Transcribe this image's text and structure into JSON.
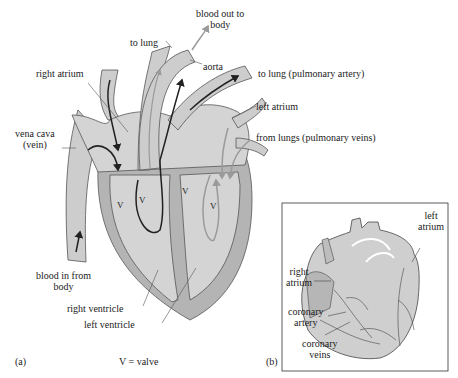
{
  "figure_a": {
    "panel_label": "(a)",
    "legend": "V = valve",
    "labels": {
      "blood_out_to_body_1": "blood out to",
      "blood_out_to_body_2": "body",
      "to_lung": "to lung",
      "aorta": "aorta",
      "to_lung_pulmonary_artery": "to lung (pulmonary artery)",
      "right_atrium": "right atrium",
      "left_atrium": "left atrium",
      "vena_cava_1": "vena cava",
      "vena_cava_2": "(vein)",
      "from_lungs": "from lungs (pulmonary veins)",
      "blood_in_from_body_1": "blood in from",
      "blood_in_from_body_2": "body",
      "right_ventricle": "right ventricle",
      "left_ventricle": "left ventricle",
      "valve_marks": [
        "V",
        "V",
        "V",
        "V"
      ]
    }
  },
  "figure_b": {
    "panel_label": "(b)",
    "labels": {
      "left_atrium_1": "left",
      "left_atrium_2": "atrium",
      "right_atrium_1": "right",
      "right_atrium_2": "atrium",
      "coronary_artery_1": "coronary",
      "coronary_artery_2": "artery",
      "coronary_veins_1": "coronary",
      "coronary_veins_2": "veins"
    }
  },
  "colors": {
    "chamber_fill": "#d4d4d4",
    "wall_fill": "#b4b4b4",
    "vessel_fill": "#cdcdcd",
    "outline": "#555555",
    "deoxy_arrow": "#222222",
    "oxy_arrow": "#9a9a9a"
  }
}
